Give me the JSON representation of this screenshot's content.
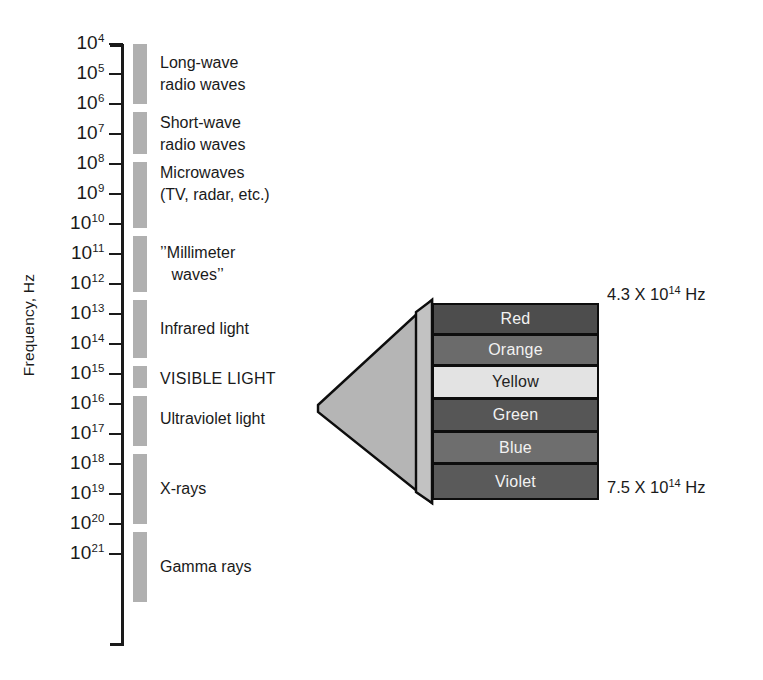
{
  "figure": {
    "axis_title": "Frequency, Hz",
    "axis": {
      "ticks": [
        {
          "label": "10",
          "exp": "4",
          "y": 44
        },
        {
          "label": "10",
          "exp": "5",
          "y": 74
        },
        {
          "label": "10",
          "exp": "6",
          "y": 104
        },
        {
          "label": "10",
          "exp": "7",
          "y": 134
        },
        {
          "label": "10",
          "exp": "8",
          "y": 164
        },
        {
          "label": "10",
          "exp": "9",
          "y": 194
        },
        {
          "label": "10",
          "exp": "10",
          "y": 224
        },
        {
          "label": "10",
          "exp": "11",
          "y": 254
        },
        {
          "label": "10",
          "exp": "12",
          "y": 284
        },
        {
          "label": "10",
          "exp": "13",
          "y": 314
        },
        {
          "label": "10",
          "exp": "14",
          "y": 344
        },
        {
          "label": "10",
          "exp": "15",
          "y": 374
        },
        {
          "label": "10",
          "exp": "16",
          "y": 404
        },
        {
          "label": "10",
          "exp": "17",
          "y": 434
        },
        {
          "label": "10",
          "exp": "18",
          "y": 464
        },
        {
          "label": "10",
          "exp": "19",
          "y": 494
        },
        {
          "label": "10",
          "exp": "20",
          "y": 524
        },
        {
          "label": "10",
          "exp": "21",
          "y": 554
        }
      ]
    },
    "bands": [
      {
        "name": "long-wave-radio-waves",
        "label": "Long-wave\nradio waves",
        "top": 44,
        "height": 60,
        "label_top": 52
      },
      {
        "name": "short-wave-radio-waves",
        "label": "Short-wave\nradio waves",
        "top": 112,
        "height": 42,
        "label_top": 112
      },
      {
        "name": "microwaves",
        "label": "Microwaves\n(TV, radar, etc.)",
        "top": 162,
        "height": 66,
        "label_top": 162
      },
      {
        "name": "millimeter-waves",
        "label": "’’Millimeter\nwaves’’",
        "top": 236,
        "height": 56,
        "label_top": 242,
        "centered": true
      },
      {
        "name": "infrared-light",
        "label": "Infrared light",
        "top": 300,
        "height": 58,
        "label_top": 318
      },
      {
        "name": "visible-light",
        "label": "VISIBLE LIGHT",
        "top": 366,
        "height": 22,
        "label_top": 368,
        "caps": true
      },
      {
        "name": "ultraviolet-light",
        "label": "Ultraviolet light",
        "top": 396,
        "height": 50,
        "label_top": 408
      },
      {
        "name": "x-rays",
        "label": "X-rays",
        "top": 454,
        "height": 70,
        "label_top": 478
      },
      {
        "name": "gamma-rays",
        "label": "Gamma rays",
        "top": 532,
        "height": 70,
        "label_top": 556
      }
    ],
    "prism": {
      "top_frequency": {
        "value": "4.3 X 10",
        "exp": "14",
        "unit": "Hz",
        "y": 296
      },
      "bottom_frequency": {
        "value": "7.5 X 10",
        "exp": "14",
        "unit": "Hz",
        "y": 489
      },
      "funnel_color": "#b5b5b5",
      "side_color": "#c2c2c2",
      "colors": [
        {
          "name": "Red",
          "top": 303,
          "height": 32,
          "fill": "#4d4d4d",
          "dark_text": false
        },
        {
          "name": "Orange",
          "top": 334,
          "height": 32,
          "fill": "#6b6b6b",
          "dark_text": false
        },
        {
          "name": "Yellow",
          "top": 365,
          "height": 34,
          "fill": "#e3e3e3",
          "dark_text": true
        },
        {
          "name": "Green",
          "top": 398,
          "height": 34,
          "fill": "#565656",
          "dark_text": false
        },
        {
          "name": "Blue",
          "top": 431,
          "height": 33,
          "fill": "#6e6e6e",
          "dark_text": false
        },
        {
          "name": "Violet",
          "top": 463,
          "height": 37,
          "fill": "#5a5a5a",
          "dark_text": false
        }
      ]
    }
  },
  "chart_data": {
    "type": "bar",
    "title": "",
    "xlabel": "",
    "ylabel": "Frequency, Hz",
    "axis_scale": "log10",
    "ylim": [
      4,
      21
    ],
    "tick_exponents": [
      4,
      5,
      6,
      7,
      8,
      9,
      10,
      11,
      12,
      13,
      14,
      15,
      16,
      17,
      18,
      19,
      20,
      21
    ],
    "grid": false,
    "legend": "none",
    "categories": [
      "Long-wave radio waves",
      "Short-wave radio waves",
      "Microwaves (TV, radar, etc.)",
      "’’Millimeter waves’’",
      "Infrared light",
      "VISIBLE LIGHT",
      "Ultraviolet light",
      "X-rays",
      "Gamma rays"
    ],
    "series": [
      {
        "name": "Frequency range (log10 Hz)",
        "ranges": [
          {
            "category": "Long-wave radio waves",
            "from": 4.0,
            "to": 6.0
          },
          {
            "category": "Short-wave radio waves",
            "from": 6.3,
            "to": 7.7
          },
          {
            "category": "Microwaves (TV, radar, etc.)",
            "from": 7.9,
            "to": 10.1
          },
          {
            "category": "’’Millimeter waves’’",
            "from": 10.4,
            "to": 12.3
          },
          {
            "category": "Infrared light",
            "from": 12.5,
            "to": 14.5
          },
          {
            "category": "VISIBLE LIGHT",
            "from": 14.7,
            "to": 15.4
          },
          {
            "category": "Ultraviolet light",
            "from": 15.7,
            "to": 17.4
          },
          {
            "category": "X-rays",
            "from": 17.7,
            "to": 20.0
          },
          {
            "category": "Gamma rays",
            "from": 20.3,
            "to": 22.6
          }
        ]
      }
    ],
    "annotations": [
      {
        "text": "4.3 X 10^14 Hz",
        "describes": "red end of visible light"
      },
      {
        "text": "7.5 X 10^14 Hz",
        "describes": "violet end of visible light"
      }
    ],
    "visible_light_detail": {
      "type": "bar",
      "categories": [
        "Red",
        "Orange",
        "Yellow",
        "Green",
        "Blue",
        "Violet"
      ],
      "frequency_low_hz": "4.3 X 10^14",
      "frequency_high_hz": "7.5 X 10^14"
    }
  }
}
